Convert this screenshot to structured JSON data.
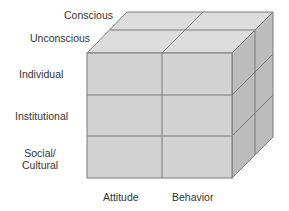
{
  "diagram": {
    "type": "3d-cube-matrix",
    "colors": {
      "top_face": "#dcdcdc",
      "front_face": "#d3d3d3",
      "side_face": "#bcbcbc",
      "grid_line": "#7a7a7a",
      "label_text": "#333333"
    },
    "depth_labels": [
      {
        "label": "Conscious"
      },
      {
        "label": "Unconscious"
      }
    ],
    "row_labels": [
      {
        "label": "Individual"
      },
      {
        "label": "Institutional"
      },
      {
        "label": "Social/",
        "label2": "Cultural"
      }
    ],
    "column_labels": [
      {
        "label": "Attitude"
      },
      {
        "label": "Behavior"
      }
    ]
  }
}
